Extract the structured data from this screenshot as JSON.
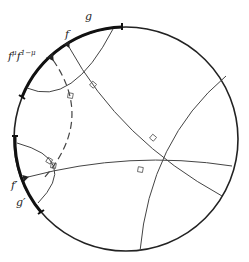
{
  "diagram": {
    "type": "hyperbolic-disk",
    "labels": {
      "g": "g",
      "f": "f",
      "f_mu": "f",
      "f_mu_exp": "μ",
      "f_mu_b": "f",
      "f_mu_b_exp": "1−μ",
      "f_prime": "f′",
      "g_prime": "g′"
    },
    "colors": {
      "stroke": "#222222",
      "thin": "#444444"
    }
  }
}
